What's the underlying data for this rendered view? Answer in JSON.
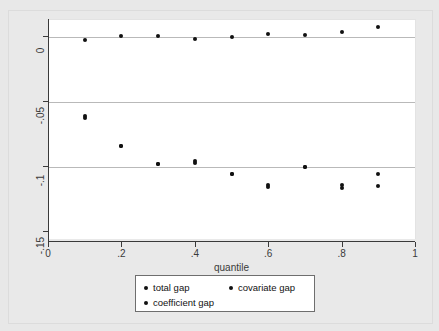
{
  "chart_data": {
    "type": "scatter",
    "title": "",
    "xlabel": "quantile",
    "ylabel": "",
    "xlim": [
      0,
      1
    ],
    "ylim": [
      -0.155,
      0.013
    ],
    "grid": true,
    "gridlines_y": [
      0,
      -0.05,
      -0.1
    ],
    "legend_position": "bottom",
    "x_ticks": [
      0,
      0.2,
      0.4,
      0.6,
      0.8,
      1
    ],
    "x_tick_labels": [
      "0",
      ".2",
      ".4",
      ".6",
      ".8",
      "1"
    ],
    "y_ticks": [
      0,
      -0.05,
      -0.1,
      -0.15
    ],
    "y_tick_labels": [
      "0",
      "-.05",
      "-.1",
      "-.15"
    ],
    "x": [
      0.1,
      0.2,
      0.3,
      0.4,
      0.5,
      0.6,
      0.7,
      0.8,
      0.9
    ],
    "series": [
      {
        "name": "total gap",
        "values": [
          -0.0605,
          -0.0837,
          -0.0976,
          -0.0968,
          -0.1049,
          -0.1135,
          -0.1001,
          -0.1137,
          -0.1049
        ]
      },
      {
        "name": "covariate gap",
        "values": [
          -0.0021,
          0.0011,
          0.001,
          -0.0019,
          0.0002,
          0.0024,
          0.0014,
          0.0035,
          0.0079
        ]
      },
      {
        "name": "coefficient gap",
        "values": [
          -0.0622,
          -0.0837,
          -0.0976,
          -0.0952,
          -0.1049,
          -0.1148,
          -0.1001,
          -0.1157,
          -0.1141
        ]
      }
    ]
  },
  "legend": {
    "entries": [
      "total gap",
      "covariate gap",
      "coefficient gap"
    ]
  },
  "colors": {
    "marker": "#111111",
    "gridline": "#b9b9b9",
    "axis": "#3a3a3a",
    "plot_background": "#ffffff",
    "figure_background": "#e8e8e8"
  }
}
